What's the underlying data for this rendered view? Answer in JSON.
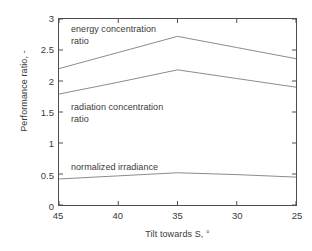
{
  "chart_data": {
    "type": "line",
    "title": "",
    "xlabel": "Tilt towards S, °",
    "ylabel": "Performance ratio, -",
    "x": [
      45,
      40,
      35,
      30,
      25
    ],
    "xlim": [
      45,
      25
    ],
    "x_reversed": true,
    "ylim": [
      0,
      3
    ],
    "yticks": [
      0,
      0.5,
      1,
      1.5,
      2,
      2.5,
      3
    ],
    "ytick_labels": [
      "0",
      "0.5",
      "1",
      "1.5",
      "2",
      "2.5",
      "3"
    ],
    "xticks": [
      45,
      40,
      35,
      30,
      25
    ],
    "xtick_labels": [
      "45",
      "40",
      "35",
      "30",
      "25"
    ],
    "grid": false,
    "legend": "in-plot annotations",
    "line_color": "#8c8c8c",
    "axis_color": "#4d4d4d",
    "text_color": "#3a3a3a",
    "background": "#ffffff",
    "series": [
      {
        "name": "energy concentration ratio",
        "label_lines": [
          "energy concentration",
          "ratio"
        ],
        "values": [
          2.2,
          2.46,
          2.72,
          2.54,
          2.36
        ]
      },
      {
        "name": "radiation concentration ratio",
        "label_lines": [
          "radiation concentration",
          "ratio"
        ],
        "values": [
          1.79,
          1.98,
          2.18,
          2.04,
          1.9
        ]
      },
      {
        "name": "normalized irradiance",
        "label_lines": [
          "normalized irradiance"
        ],
        "values": [
          0.42,
          0.47,
          0.52,
          0.49,
          0.45
        ]
      }
    ]
  },
  "axes": {
    "y_title": "Performance ratio, -",
    "x_title_text": "Tilt towards S, ",
    "x_title_degree": "°"
  },
  "annotations": {
    "energy": "energy concentration\nratio",
    "radiation": "radiation concentration\nratio",
    "irradiance": "normalized irradiance"
  }
}
